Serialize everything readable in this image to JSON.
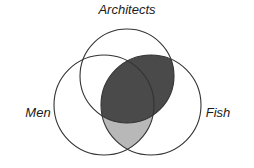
{
  "figure": {
    "type": "venn-diagram",
    "background_color": "#ffffff",
    "outline_color": "#333333",
    "labels": {
      "top": "Architects",
      "left": "Men",
      "right": "Fish"
    }
  },
  "chart_data": {
    "type": "venn",
    "title": "",
    "sets": [
      {
        "name": "Architects",
        "label": "Architects",
        "cx": 127,
        "cy": 76,
        "r": 47,
        "label_x": 127,
        "label_y": 14,
        "label_anchor": "middle"
      },
      {
        "name": "Men",
        "label": "Men",
        "cx": 104,
        "cy": 105,
        "r": 50,
        "label_x": 38,
        "label_y": 117,
        "label_anchor": "middle"
      },
      {
        "name": "Fish",
        "label": "Fish",
        "cx": 151,
        "cy": 105,
        "r": 50,
        "label_x": 218,
        "label_y": 117,
        "label_anchor": "middle"
      }
    ],
    "shaded_regions": [
      {
        "name": "architects-and-fish",
        "sets": [
          "Architects",
          "Fish"
        ],
        "excludes": [],
        "color": "#4a4a4a",
        "shade": "dark"
      },
      {
        "name": "men-and-fish-only",
        "sets": [
          "Men",
          "Fish"
        ],
        "excludes": [
          "Architects"
        ],
        "color": "#b8b8b8",
        "shade": "light"
      }
    ],
    "unshaded_regions": [
      {
        "name": "architects-only",
        "sets": [
          "Architects"
        ]
      },
      {
        "name": "men-only",
        "sets": [
          "Men"
        ]
      },
      {
        "name": "fish-only",
        "sets": [
          "Fish"
        ]
      },
      {
        "name": "architects-and-men-only",
        "sets": [
          "Architects",
          "Men"
        ]
      }
    ],
    "colors": {
      "dark_fill": "#4a4a4a",
      "light_fill": "#b8b8b8",
      "outline": "#333333",
      "background": "#ffffff"
    }
  }
}
